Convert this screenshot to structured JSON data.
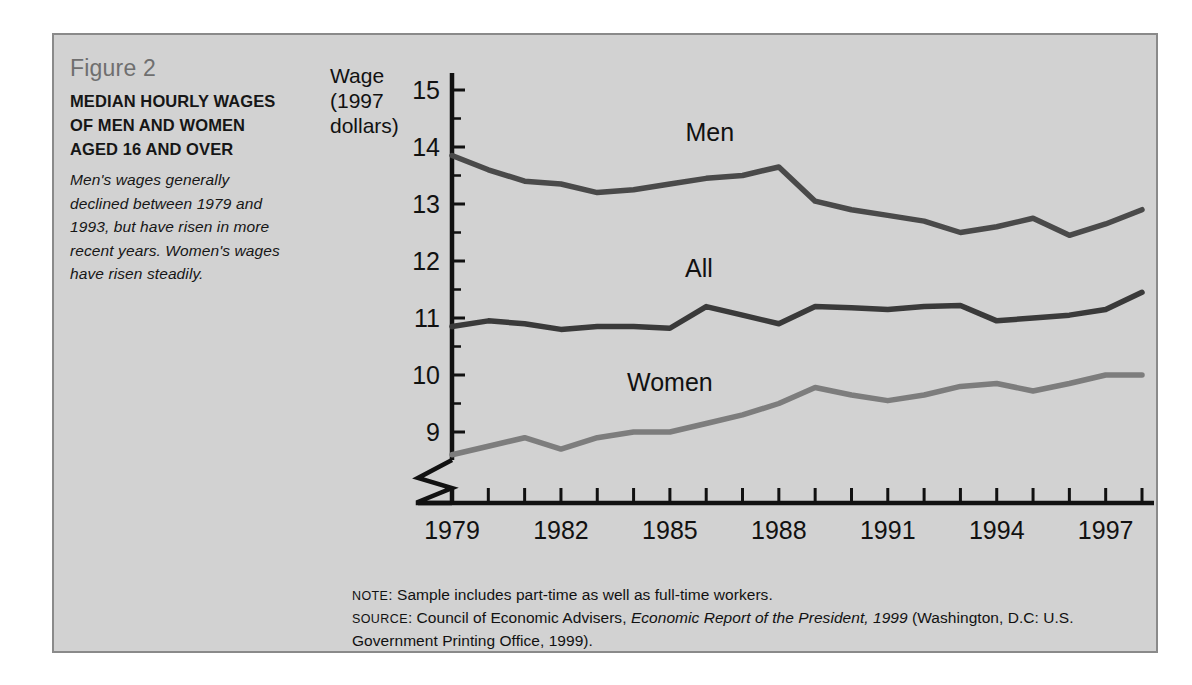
{
  "figure": {
    "number": "Figure 2",
    "title": "MEDIAN HOURLY WAGES OF MEN AND WOMEN AGED 16 AND OVER",
    "description": "Men's wages generally declined between 1979 and 1993, but have risen in more recent years. Women's wages have risen steadily."
  },
  "footnotes": {
    "note_label": "NOTE",
    "note_text": ": Sample includes part-time as well as full-time workers.",
    "source_label": "SOURCE",
    "source_pre": ": Council of Economic Advisers, ",
    "source_italic": "Economic Report of the President, 1999",
    "source_post": " (Washington, D.C: U.S. Government Printing Office, 1999)."
  },
  "colors": {
    "panel_bg": "#d2d2d2",
    "panel_border": "#8a8a8a",
    "axis": "#111111",
    "men_line": "#4a4a4a",
    "all_line": "#3a3a3a",
    "women_line": "#7d7d7d",
    "fig_number": "#6f6f6f"
  },
  "chart_data": {
    "type": "line",
    "title": "MEDIAN HOURLY WAGES OF MEN AND WOMEN AGED 16 AND OVER",
    "xlabel": "Year",
    "ylabel": "Wage (1997 dollars)",
    "ylabel_lines": [
      "Wage",
      "(1997",
      "dollars)"
    ],
    "xlim": [
      1979,
      1998
    ],
    "ylim": [
      8.5,
      15.3
    ],
    "y_ticks": [
      9,
      10,
      11,
      12,
      13,
      14,
      15
    ],
    "y_tick_labels": [
      "9",
      "10",
      "11",
      "12",
      "13",
      "14",
      "15"
    ],
    "y_minor_step": 0.5,
    "x_ticks": [
      1979,
      1980,
      1981,
      1982,
      1983,
      1984,
      1985,
      1986,
      1987,
      1988,
      1989,
      1990,
      1991,
      1992,
      1993,
      1994,
      1995,
      1996,
      1997,
      1998
    ],
    "x_tick_labels_shown": [
      "1979",
      "1982",
      "1985",
      "1988",
      "1991",
      "1994",
      "1997"
    ],
    "x_label_years": [
      1979,
      1982,
      1985,
      1988,
      1991,
      1994,
      1997
    ],
    "grid": false,
    "legend": "inline-series-labels",
    "axis_break": true,
    "x": [
      1979,
      1980,
      1981,
      1982,
      1983,
      1984,
      1985,
      1986,
      1987,
      1988,
      1989,
      1990,
      1991,
      1992,
      1993,
      1994,
      1995,
      1996,
      1997,
      1998
    ],
    "series": [
      {
        "name": "Men",
        "color": "#4a4a4a",
        "label_x": 1986.1,
        "label_y": 14.1,
        "values": [
          13.85,
          13.6,
          13.4,
          13.35,
          13.2,
          13.25,
          13.35,
          13.45,
          13.5,
          13.65,
          13.05,
          12.9,
          12.8,
          12.7,
          12.5,
          12.6,
          12.75,
          12.45,
          12.65,
          12.9
        ]
      },
      {
        "name": "All",
        "color": "#3a3a3a",
        "label_x": 1985.8,
        "label_y": 11.72,
        "values": [
          10.85,
          10.95,
          10.9,
          10.8,
          10.85,
          10.85,
          10.82,
          11.2,
          11.05,
          10.9,
          11.2,
          11.18,
          11.15,
          11.2,
          11.22,
          10.95,
          11.0,
          11.05,
          11.15,
          11.45
        ]
      },
      {
        "name": "Women",
        "color": "#7d7d7d",
        "label_x": 1985.0,
        "label_y": 9.72,
        "values": [
          8.6,
          8.75,
          8.9,
          8.7,
          8.9,
          9.0,
          9.0,
          9.15,
          9.3,
          9.5,
          9.78,
          9.65,
          9.55,
          9.65,
          9.8,
          9.85,
          9.72,
          9.85,
          10.0,
          10.0
        ]
      }
    ]
  }
}
